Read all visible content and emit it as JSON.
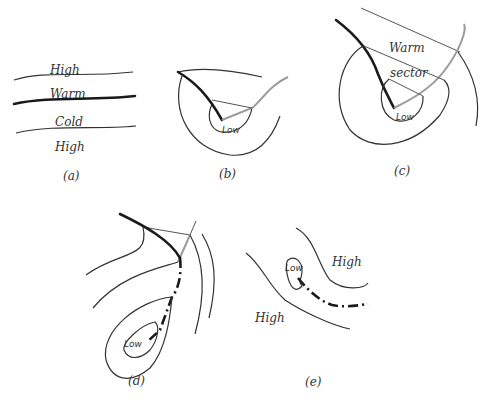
{
  "figure": {
    "panels": [
      {
        "id": "a",
        "caption": "(a)",
        "labels": [
          "High",
          "Warm",
          "Cold",
          "High"
        ]
      },
      {
        "id": "b",
        "caption": "(b)",
        "labels": [
          "Low"
        ]
      },
      {
        "id": "c",
        "caption": "(c)",
        "labels": [
          "Warm",
          "sector",
          "Low"
        ]
      },
      {
        "id": "d",
        "caption": "(d)",
        "labels": [
          "Low"
        ]
      },
      {
        "id": "e",
        "caption": "(e)",
        "labels": [
          "Low",
          "High",
          "High"
        ]
      }
    ]
  }
}
